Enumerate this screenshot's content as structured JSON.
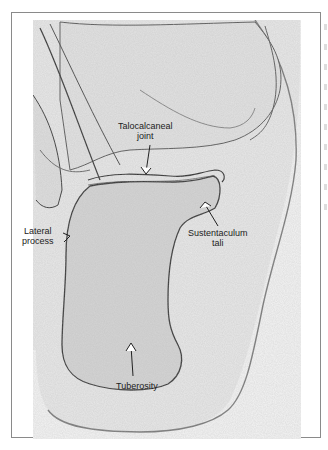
{
  "figure": {
    "frame_color": "#8a8a8a",
    "bone_outline_color": "#3a3a3a",
    "soft_tissue_color": "#ececec",
    "bone_fill_color": "#d6d6d6",
    "labels": [
      {
        "id": "talocalcaneal",
        "line1": "Talocalcaneal",
        "line2": "joint"
      },
      {
        "id": "lateral",
        "line1": "Lateral",
        "line2": "process"
      },
      {
        "id": "sustentaculum",
        "line1": "Sustentaculum",
        "line2": "tali"
      },
      {
        "id": "tuberosity",
        "line1": "Tuberosity",
        "line2": ""
      }
    ]
  }
}
